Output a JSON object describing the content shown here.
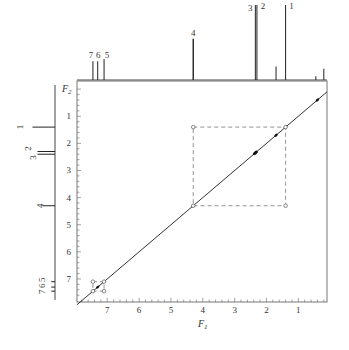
{
  "chart_data": {
    "type": "heatmap",
    "subtype": "2D NMR COSY contour plot with 1D projections",
    "title": "",
    "xlabel": "F1",
    "ylabel": "F2",
    "x_ticks": [
      "7",
      "6",
      "5",
      "4",
      "3",
      "2",
      "1"
    ],
    "y_ticks": [
      "1",
      "2",
      "3",
      "4",
      "5",
      "6",
      "7"
    ],
    "xlim": [
      7.95,
      0.1
    ],
    "ylim": [
      -0.3,
      7.85
    ],
    "grid": false,
    "top_spectrum_peaks": [
      {
        "label": "7",
        "ppm": 7.45,
        "height": 0.25
      },
      {
        "label": "6",
        "ppm": 7.3,
        "height": 0.25
      },
      {
        "label": "5",
        "ppm": 7.1,
        "height": 0.28
      },
      {
        "label": "4",
        "ppm": 4.3,
        "height": 0.55
      },
      {
        "label": "3",
        "ppm": 2.35,
        "height": 1.0
      },
      {
        "label": "2",
        "ppm": 2.3,
        "height": 1.0
      },
      {
        "label": "",
        "ppm": 1.7,
        "height": 0.18
      },
      {
        "label": "1",
        "ppm": 1.4,
        "height": 1.0
      },
      {
        "label": "",
        "ppm": 0.45,
        "height": 0.05
      },
      {
        "label": "",
        "ppm": 0.2,
        "height": 0.15
      }
    ],
    "left_spectrum_peaks": [
      {
        "label": "1",
        "ppm": 1.4,
        "height": 0.9
      },
      {
        "label": "2",
        "ppm": 2.3,
        "height": 0.7
      },
      {
        "label": "3",
        "ppm": 2.4,
        "height": 0.7
      },
      {
        "label": "4",
        "ppm": 4.3,
        "height": 0.5
      },
      {
        "label": "7",
        "ppm": 7.45,
        "height": 0.15
      },
      {
        "label": "6",
        "ppm": 7.3,
        "height": 0.15
      },
      {
        "label": "5",
        "ppm": 7.1,
        "height": 0.15
      }
    ],
    "diagonal_peaks_ppm": [
      0.4,
      1.4,
      1.7,
      2.35,
      4.3,
      7.1,
      7.3,
      7.45
    ],
    "cross_peaks": [
      {
        "x": 4.3,
        "y": 1.4
      },
      {
        "x": 1.4,
        "y": 4.3
      }
    ],
    "annotations": [
      {
        "type": "dashed-box",
        "x1": 4.3,
        "x2": 1.4,
        "y1": 1.4,
        "y2": 4.3,
        "description": "correlation between peak 4 and peak 1"
      },
      {
        "type": "dashed-box",
        "x1": 7.45,
        "x2": 7.1,
        "y1": 7.1,
        "y2": 7.45,
        "description": "aromatic correlations 5-6-7"
      }
    ]
  },
  "axes": {
    "x_title": "F",
    "x_sub": "1",
    "y_title": "F",
    "y_sub": "2"
  }
}
